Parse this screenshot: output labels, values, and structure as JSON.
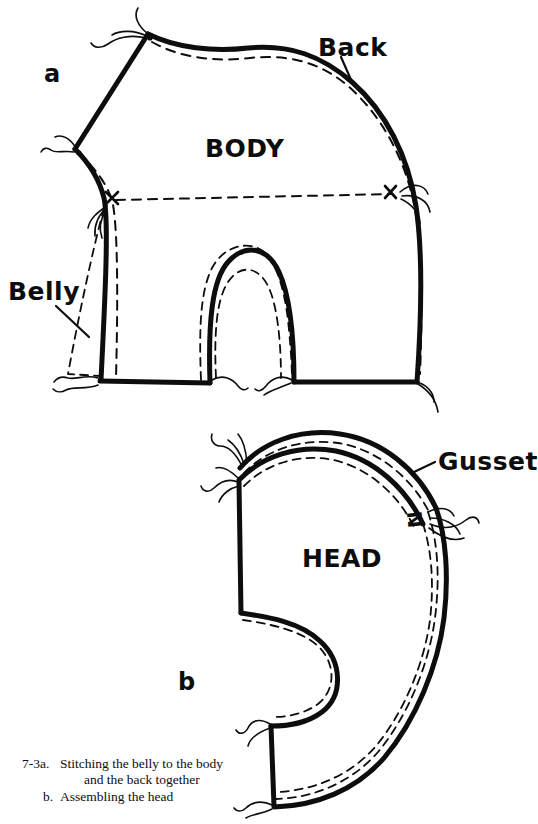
{
  "figure": {
    "number": "7-3",
    "panels": [
      {
        "id": "a",
        "marker": "a",
        "title": "Stitching the belly to the body and the back together"
      },
      {
        "id": "b",
        "marker": "b",
        "title": "Assembling the head"
      }
    ]
  },
  "labels": {
    "back": "Back",
    "belly": "Belly",
    "body": "BODY",
    "head": "HEAD",
    "gusset": "Gusset",
    "panel_a": "a",
    "panel_b": "b",
    "match_mark_left": "x",
    "match_mark_right": "x",
    "notch_mark": "N"
  },
  "caption": {
    "line1_number": "7-3a.",
    "line1_text": "Stitching the belly to the body",
    "line2_text": "and the back together",
    "line3_number": "b.",
    "line3_text": "Assembling the head"
  },
  "colors": {
    "ink": "#0d0d0d",
    "paper": "#ffffff"
  },
  "style": {
    "seam_line": "solid heavy",
    "stitch_line": "dashed",
    "thread_tails": "wavy"
  }
}
